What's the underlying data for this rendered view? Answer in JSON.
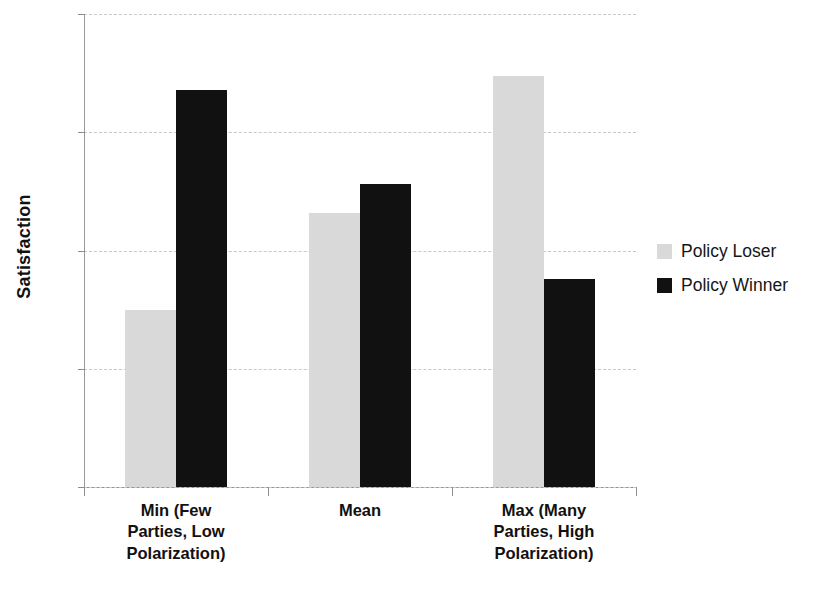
{
  "chart_data": {
    "type": "bar",
    "title": "",
    "subtitle": "",
    "xlabel": "",
    "ylabel": "Satisfaction",
    "ylim": [
      2,
      3
    ],
    "yticks": [
      "2",
      "2.25",
      "2.5",
      "2.75",
      "3"
    ],
    "ytick_values": [
      2,
      2.25,
      2.5,
      2.75,
      3
    ],
    "grid": true,
    "legend_position": "right",
    "categories": [
      "Min (Few Parties, Low Polarization)",
      "Mean",
      "Max (Many Parties, High Polarization)"
    ],
    "category_lines": [
      [
        "Min (Few",
        "Parties, Low",
        "Polarization)"
      ],
      [
        "Mean"
      ],
      [
        "Max (Many",
        "Parties, High",
        "Polarization)"
      ]
    ],
    "series": [
      {
        "name": "Policy Loser",
        "color": "#d9d9d9",
        "values": [
          2.375,
          2.58,
          2.87
        ]
      },
      {
        "name": "Policy Winner",
        "color": "#111111",
        "values": [
          2.84,
          2.64,
          2.44
        ]
      }
    ]
  },
  "legend": {
    "entries": [
      {
        "label": "Policy Loser",
        "color": "#d9d9d9",
        "swatch_name": "legend-swatch-policy-loser"
      },
      {
        "label": "Policy Winner",
        "color": "#111111",
        "swatch_name": "legend-swatch-policy-winner"
      }
    ]
  },
  "axes": {
    "y_title": "Satisfaction"
  }
}
